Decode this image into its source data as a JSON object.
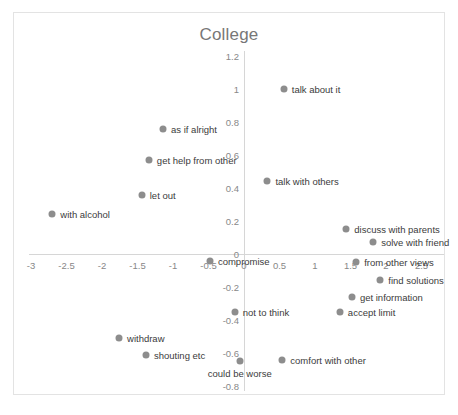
{
  "figure": {
    "caption": ""
  },
  "chart_data": {
    "type": "scatter",
    "title": "College",
    "xlabel": "",
    "ylabel": "",
    "xlim": [
      -3.25,
      2.75
    ],
    "ylim": [
      -0.8,
      1.2
    ],
    "grid": false,
    "legend": "none",
    "marker_color": "#8d8d8d",
    "axis_color": "#d6d6d6",
    "tick_color": "#888888",
    "title_color": "#777777",
    "xticks": [
      -3,
      -2.5,
      -2,
      -1.5,
      -1,
      -0.5,
      0,
      0.5,
      1,
      1.5,
      2,
      2.5
    ],
    "xtick_labels": [
      "-3",
      "-2.5",
      "-2",
      "-1.5",
      "-1",
      "-0.5",
      "0",
      "0.5",
      "1",
      "1.5",
      "2",
      "2.5"
    ],
    "yticks": [
      -0.8,
      -0.6,
      -0.4,
      -0.2,
      0,
      0.2,
      0.4,
      0.6,
      0.8,
      1,
      1.2
    ],
    "ytick_labels": [
      "-0.8",
      "-0.6",
      "-0.4",
      "-0.2",
      "0",
      "0.2",
      "0.4",
      "0.6",
      "0.8",
      "1",
      "1.2"
    ],
    "points": [
      {
        "label": "talk about it",
        "x": 0.56,
        "y": 1.0,
        "label_pos": "right"
      },
      {
        "label": "as if alright",
        "x": -1.14,
        "y": 0.76,
        "label_pos": "right"
      },
      {
        "label": "get help from other",
        "x": -1.34,
        "y": 0.57,
        "label_pos": "right"
      },
      {
        "label": "talk with others",
        "x": 0.33,
        "y": 0.44,
        "label_pos": "right"
      },
      {
        "label": "let out",
        "x": -1.44,
        "y": 0.36,
        "label_pos": "right"
      },
      {
        "label": "with alcohol",
        "x": -2.7,
        "y": 0.24,
        "label_pos": "right"
      },
      {
        "label": "discuss with parents",
        "x": 1.44,
        "y": 0.15,
        "label_pos": "right"
      },
      {
        "label": "solve with friend",
        "x": 1.82,
        "y": 0.07,
        "label_pos": "right"
      },
      {
        "label": "from other views",
        "x": 1.58,
        "y": -0.05,
        "label_pos": "right"
      },
      {
        "label": "compromise",
        "x": -0.48,
        "y": -0.04,
        "label_pos": "right"
      },
      {
        "label": "find solutions",
        "x": 1.92,
        "y": -0.16,
        "label_pos": "right"
      },
      {
        "label": "get information",
        "x": 1.52,
        "y": -0.26,
        "label_pos": "right"
      },
      {
        "label": "not to think",
        "x": -0.13,
        "y": -0.35,
        "label_pos": "right"
      },
      {
        "label": "accept limit",
        "x": 1.35,
        "y": -0.35,
        "label_pos": "right"
      },
      {
        "label": "withdraw",
        "x": -1.76,
        "y": -0.51,
        "label_pos": "right"
      },
      {
        "label": "shouting etc",
        "x": -1.38,
        "y": -0.61,
        "label_pos": "right"
      },
      {
        "label": "comfort with other",
        "x": 0.54,
        "y": -0.64,
        "label_pos": "right"
      },
      {
        "label": "could be worse",
        "x": -0.06,
        "y": -0.65,
        "label_pos": "below"
      }
    ]
  }
}
